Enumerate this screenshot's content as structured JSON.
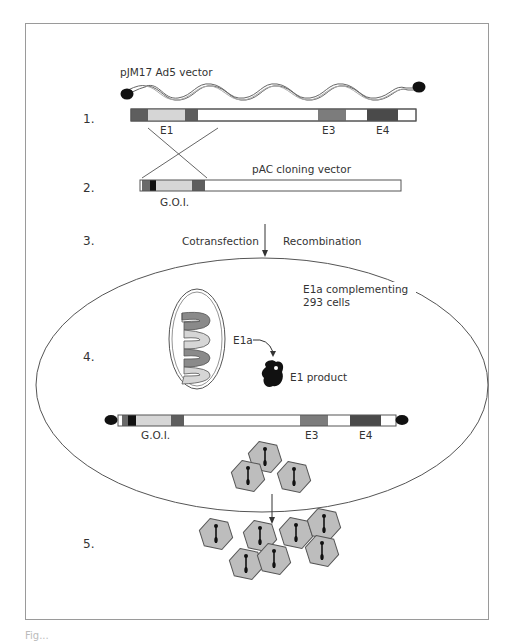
{
  "figure": {
    "steps": [
      {
        "number": "1.",
        "label": "pJM17 Ad5 vector"
      },
      {
        "number": "2.",
        "label": "pAC cloning vector"
      },
      {
        "number": "3."
      },
      {
        "number": "4."
      },
      {
        "number": "5."
      }
    ],
    "step1": {
      "vector_label": "pJM17 Ad5 vector",
      "regions": [
        "E1",
        "E3",
        "E4"
      ]
    },
    "step2": {
      "vector_label": "pAC cloning vector",
      "insert_label": "G.O.I."
    },
    "step3": {
      "left_label": "Cotransfection",
      "right_label": "Recombination"
    },
    "step4": {
      "cell_label_line1": "E1a complementing",
      "cell_label_line2": "293 cells",
      "gene_label": "E1a",
      "product_label": "E1 product",
      "regions": [
        "G.O.I.",
        "E3",
        "E4"
      ]
    },
    "step5": {
      "virion_count": 7
    },
    "colors": {
      "dark_segment": "#5e5e5e",
      "mid_segment": "#7c7c7c",
      "light_segment": "#d6d6d6",
      "black_segment": "#111111",
      "e4_segment": "#4a4a4a",
      "virion_fill": "#bdbdbd",
      "line": "#444444",
      "frame": "#9a9a9a"
    },
    "caption_fragment": "Fig..."
  }
}
